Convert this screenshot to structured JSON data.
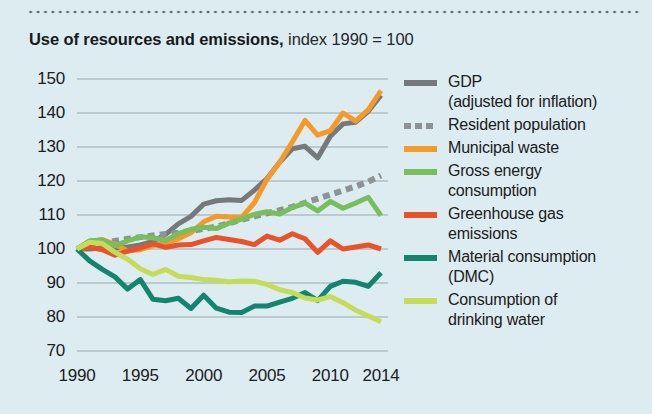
{
  "figure": {
    "title_strong": "Use of resources and emissions,",
    "title_light": " index 1990 = 100"
  },
  "chart_data": {
    "type": "line",
    "title": "Use of resources and emissions, index 1990 = 100",
    "subtitle": "index 1990 = 100",
    "xlabel": "",
    "ylabel": "",
    "xlim": [
      1990,
      2014
    ],
    "ylim": [
      70,
      150
    ],
    "grid": true,
    "grid_axis": "y",
    "legend_position": "right",
    "x_ticks": [
      "1990",
      "1995",
      "2000",
      "2005",
      "2010",
      "2014"
    ],
    "x_tick_values": [
      1990,
      1995,
      2000,
      2005,
      2010,
      2014
    ],
    "y_ticks": [
      "70",
      "80",
      "90",
      "100",
      "110",
      "120",
      "130",
      "140",
      "150"
    ],
    "y_tick_values": [
      70,
      80,
      90,
      100,
      110,
      120,
      130,
      140,
      150
    ],
    "x": [
      1990,
      1991,
      1992,
      1993,
      1994,
      1995,
      1996,
      1997,
      1998,
      1999,
      2000,
      2001,
      2002,
      2003,
      2004,
      2005,
      2006,
      2007,
      2008,
      2009,
      2010,
      2011,
      2012,
      2013,
      2014
    ],
    "series": [
      {
        "name": "GDP",
        "legend_label": "GDP (adjusted for inflation)",
        "legend_line1": "GDP",
        "legend_line2": "(adjusted for inflation)",
        "color": "#76797b",
        "style": "solid",
        "width": 5,
        "values": [
          100,
          100,
          100.4,
          100.2,
          100.6,
          101.2,
          102.2,
          104.3,
          107.4,
          109.6,
          113.2,
          114.2,
          114.5,
          114.3,
          117.3,
          120.7,
          125.5,
          129.5,
          130.2,
          126.8,
          133.2,
          136.8,
          137.3,
          140.5,
          145.2
        ]
      },
      {
        "name": "Resident population",
        "legend_label": "Resident population",
        "legend_line1": "Resident population",
        "legend_line2": "",
        "color": "#8d9295",
        "style": "dotted",
        "width": 6,
        "values": [
          100,
          100.8,
          101.6,
          102.4,
          103.0,
          103.5,
          104.0,
          104.4,
          104.8,
          105.3,
          105.9,
          106.6,
          107.6,
          108.6,
          109.6,
          110.5,
          111.4,
          112.4,
          113.6,
          114.8,
          116.0,
          117.2,
          118.4,
          119.8,
          121.6
        ]
      },
      {
        "name": "Municipal waste",
        "legend_label": "Municipal waste",
        "legend_line1": "Municipal waste",
        "legend_line2": "",
        "color": "#f59a28",
        "style": "solid",
        "width": 5,
        "values": [
          100,
          102.3,
          102.8,
          101.4,
          99.4,
          99.8,
          101.0,
          101.8,
          103.0,
          104.8,
          108.0,
          109.6,
          109.4,
          109.3,
          113.6,
          120.5,
          125.5,
          131.5,
          137.8,
          133.5,
          134.8,
          140.0,
          137.6,
          141.0,
          146.6
        ]
      },
      {
        "name": "Gross energy consumption",
        "legend_label": "Gross energy consumption",
        "legend_line1": "Gross energy",
        "legend_line2": "consumption",
        "color": "#79be5c",
        "style": "solid",
        "width": 5,
        "values": [
          100,
          102.4,
          102.6,
          101.0,
          102.4,
          103.6,
          103.3,
          102.5,
          104.5,
          105.8,
          106.4,
          106.0,
          107.6,
          108.8,
          110.2,
          111.0,
          110.3,
          112.2,
          113.5,
          111.2,
          114.0,
          112.0,
          113.5,
          115.2,
          109.8
        ]
      },
      {
        "name": "Greenhouse gas emissions",
        "legend_label": "Greenhouse gas emissions",
        "legend_line1": "Greenhouse gas",
        "legend_line2": "emissions",
        "color": "#e8532a",
        "style": "solid",
        "width": 5,
        "values": [
          100,
          100.5,
          99.8,
          98.2,
          99.4,
          100.3,
          101.5,
          100.5,
          101.2,
          101.3,
          102.4,
          103.4,
          102.8,
          102.2,
          101.3,
          103.8,
          102.6,
          104.5,
          103.0,
          99.0,
          102.4,
          100.0,
          100.6,
          101.2,
          100.0
        ]
      },
      {
        "name": "Material consumption (DMC)",
        "legend_label": "Material consumption (DMC)",
        "legend_line1": "Material consumption",
        "legend_line2": "(DMC)",
        "color": "#13856e",
        "style": "solid",
        "width": 5,
        "values": [
          100,
          96.5,
          94.0,
          91.8,
          88.2,
          91.0,
          85.2,
          84.8,
          85.5,
          82.5,
          86.4,
          82.6,
          81.4,
          81.3,
          83.2,
          83.2,
          84.4,
          85.5,
          87.2,
          84.8,
          89.0,
          90.5,
          90.2,
          89.0,
          93.0
        ]
      },
      {
        "name": "Consumption of drinking water",
        "legend_label": "Consumption of drinking water",
        "legend_line1": "Consumption of",
        "legend_line2": "drinking water",
        "color": "#c5dc58",
        "style": "solid",
        "width": 5,
        "values": [
          100,
          102.0,
          101.6,
          99.0,
          97.0,
          94.2,
          92.5,
          94.0,
          92.0,
          91.6,
          91.0,
          90.8,
          90.4,
          90.6,
          90.5,
          89.6,
          88.0,
          87.2,
          85.6,
          85.0,
          86.0,
          84.2,
          82.0,
          80.3,
          78.6
        ]
      }
    ]
  },
  "legend": {
    "items": [
      {
        "label_line1": "GDP",
        "label_line2": "(adjusted for inflation)",
        "color": "#76797b",
        "style": "solid",
        "name": "gdp"
      },
      {
        "label_line1": "Resident population",
        "label_line2": "",
        "color": "#8d9295",
        "style": "dotted",
        "name": "resident-population"
      },
      {
        "label_line1": "Municipal waste",
        "label_line2": "",
        "color": "#f59a28",
        "style": "solid",
        "name": "municipal-waste"
      },
      {
        "label_line1": "Gross energy",
        "label_line2": "consumption",
        "color": "#79be5c",
        "style": "solid",
        "name": "gross-energy-consumption"
      },
      {
        "label_line1": "Greenhouse gas",
        "label_line2": "emissions",
        "color": "#e8532a",
        "style": "solid",
        "name": "greenhouse-gas-emissions"
      },
      {
        "label_line1": "Material consumption",
        "label_line2": "(DMC)",
        "color": "#13856e",
        "style": "solid",
        "name": "material-consumption-dmc"
      },
      {
        "label_line1": "Consumption of",
        "label_line2": "drinking water",
        "color": "#c5dc58",
        "style": "solid",
        "name": "consumption-of-drinking-water"
      }
    ]
  },
  "colors": {
    "background": "#dcecf0",
    "gridline": "#9aa7ab",
    "text": "#1b2022",
    "rule": "#5a6b70"
  }
}
